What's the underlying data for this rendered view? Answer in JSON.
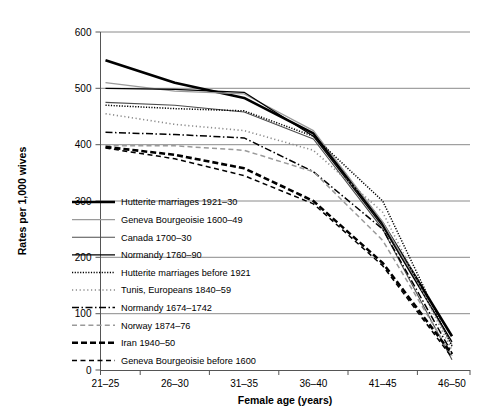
{
  "chart_data": {
    "type": "line",
    "title": "",
    "xlabel": "Female age (years)",
    "ylabel": "Rates per 1,000 wives",
    "categories": [
      "21–25",
      "26–30",
      "31–35",
      "36–40",
      "41–45",
      "46–50"
    ],
    "ylim": [
      0,
      600
    ],
    "yticks": [
      0,
      100,
      200,
      300,
      400,
      500,
      600
    ],
    "ytick_labels": [
      "0",
      "100",
      "200",
      "300",
      "400",
      "500",
      "600"
    ],
    "grid": "horizontal",
    "legend_position": "inside-lower-left",
    "series": [
      {
        "name": "Hutterite marriages 1921–30",
        "values": [
          550,
          510,
          483,
          420,
          260,
          60
        ],
        "style": "solid",
        "color": "#000000",
        "width": 2.6
      },
      {
        "name": "Geneva Bourgeoisie 1600–49",
        "values": [
          510,
          495,
          490,
          425,
          263,
          45
        ],
        "style": "solid",
        "color": "#9a9a9a",
        "width": 1.3
      },
      {
        "name": "Canada 1700–30",
        "values": [
          475,
          470,
          458,
          410,
          250,
          18
        ],
        "style": "solid",
        "color": "#4d4d4d",
        "width": 1.1
      },
      {
        "name": "Normandy 1760–90",
        "values": [
          500,
          498,
          493,
          415,
          255,
          50
        ],
        "style": "solid",
        "color": "#000000",
        "width": 1.3
      },
      {
        "name": "Hutterite marriages before 1921",
        "values": [
          470,
          464,
          460,
          415,
          300,
          42
        ],
        "style": "dotted-fine",
        "color": "#000000",
        "width": 1.5
      },
      {
        "name": "Tunis, Europeans 1840–59",
        "values": [
          455,
          436,
          425,
          390,
          280,
          35
        ],
        "style": "dotted-sparse",
        "color": "#8a8a8a",
        "width": 1.6
      },
      {
        "name": "Normandy 1674–1742",
        "values": [
          422,
          418,
          412,
          352,
          250,
          30
        ],
        "style": "dashdot",
        "color": "#000000",
        "width": 1.5
      },
      {
        "name": "Norway 1874–76",
        "values": [
          398,
          398,
          390,
          352,
          230,
          25
        ],
        "style": "dashed-light",
        "color": "#9a9a9a",
        "width": 1.5
      },
      {
        "name": "Iran 1940–50",
        "values": [
          396,
          382,
          358,
          300,
          190,
          28
        ],
        "style": "dashed-bold",
        "color": "#000000",
        "width": 2.6
      },
      {
        "name": "Geneva Bourgeoisie before 1600",
        "values": [
          394,
          375,
          345,
          295,
          185,
          22
        ],
        "style": "dashed",
        "color": "#000000",
        "width": 1.5
      }
    ]
  }
}
